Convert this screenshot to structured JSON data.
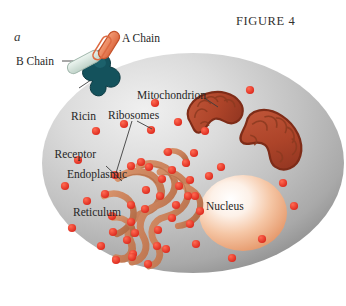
{
  "figure": {
    "title": "FIGURE 4",
    "panel_letter": "a",
    "width": 346,
    "height": 306,
    "background_color": "#ffffff"
  },
  "labels": {
    "a_chain": "A Chain",
    "b_chain": "B Chain",
    "ricin_receptor_line1": "Ricin",
    "ricin_receptor_line2": "Receptor",
    "mitochondrion": "Mitochondrion",
    "ribosomes": "Ribosomes",
    "er_line1": "Endoplasmic",
    "er_line2": "Reticulum",
    "nucleus": "Nucleus"
  },
  "colors": {
    "text": "#262626",
    "title": "#33312f",
    "leader_line": "#3c3c3c",
    "cell_rim": "#8e8e8e",
    "cell_mid": "#b9b9b9",
    "cell_light": "#e6e6e6",
    "nucleus_center": "#ffffff",
    "nucleus_edge": "#e79a6a",
    "ribosome": "#e8342a",
    "er_membrane": "#c8805a",
    "er_membrane_dark": "#a6603c",
    "mitochondrion_fill": "#b5472c",
    "mitochondrion_outline": "#7e2c18",
    "mitochondrion_cristae": "#8c3a20",
    "a_chain": "#e8794f",
    "a_chain_outline": "#c4532c",
    "b_chain": "#d3e2da",
    "b_chain_outline": "#9fb5aa",
    "receptor": "#14525c",
    "receptor_dark": "#0d3a42",
    "linker": "#6d6d6d"
  },
  "structures": {
    "cell": {
      "name": "cell-body",
      "shape": "ellipse",
      "cx": 193,
      "cy": 163,
      "rx": 151,
      "ry": 110
    },
    "nucleus": {
      "name": "nucleus",
      "shape": "ellipse",
      "cx": 243,
      "cy": 213,
      "rx": 44,
      "ry": 38
    },
    "mitochondria": [
      {
        "name": "mitochondrion-upper-left",
        "cx": 215,
        "cy": 113,
        "angle": -28
      },
      {
        "name": "mitochondrion-lower-right",
        "cx": 272,
        "cy": 140,
        "angle": 18
      }
    ],
    "endoplasmic_reticulum": {
      "name": "endoplasmic-reticulum",
      "center_x": 145,
      "center_y": 205
    },
    "ricin_complex": {
      "a_chain": {
        "cx": 108,
        "cy": 44
      },
      "b_chain": {
        "cx": 85,
        "cy": 62
      },
      "receptor": {
        "cx": 100,
        "cy": 78
      }
    },
    "free_ribosomes": [
      {
        "x": 96,
        "y": 131
      },
      {
        "x": 124,
        "y": 124
      },
      {
        "x": 151,
        "y": 130
      },
      {
        "x": 178,
        "y": 122
      },
      {
        "x": 205,
        "y": 131
      },
      {
        "x": 78,
        "y": 160
      },
      {
        "x": 65,
        "y": 186
      },
      {
        "x": 87,
        "y": 201
      },
      {
        "x": 194,
        "y": 153
      },
      {
        "x": 209,
        "y": 176
      },
      {
        "x": 188,
        "y": 196
      },
      {
        "x": 221,
        "y": 167
      },
      {
        "x": 72,
        "y": 228
      },
      {
        "x": 101,
        "y": 246
      },
      {
        "x": 132,
        "y": 257
      },
      {
        "x": 166,
        "y": 249
      },
      {
        "x": 196,
        "y": 244
      },
      {
        "x": 232,
        "y": 258
      },
      {
        "x": 262,
        "y": 239
      },
      {
        "x": 283,
        "y": 183
      },
      {
        "x": 294,
        "y": 206
      },
      {
        "x": 250,
        "y": 90
      },
      {
        "x": 155,
        "y": 103
      }
    ]
  }
}
